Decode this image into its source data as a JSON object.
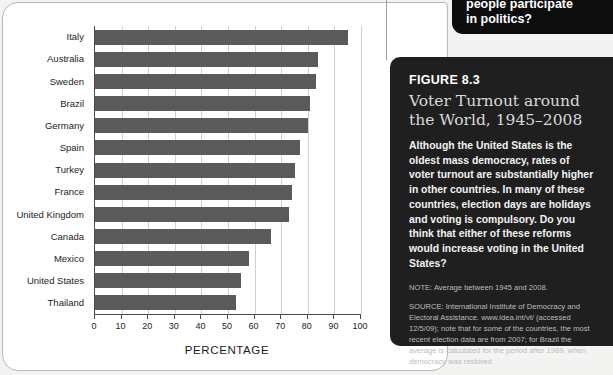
{
  "chart_data": {
    "type": "bar",
    "orientation": "horizontal",
    "title": "Voter Turnout around the World, 1945–2008",
    "xlabel": "PERCENTAGE",
    "ylabel": "",
    "xlim": [
      0,
      100
    ],
    "grid": true,
    "legend": false,
    "bar_color": "#5a5a5a",
    "categories": [
      "Italy",
      "Australia",
      "Sweden",
      "Brazil",
      "Germany",
      "Spain",
      "Turkey",
      "France",
      "United Kingdom",
      "Canada",
      "Mexico",
      "United States",
      "Thailand"
    ],
    "values": [
      95,
      84,
      83,
      81,
      80,
      77,
      75,
      74,
      73,
      66,
      58,
      55,
      53
    ],
    "xticks": [
      0,
      10,
      20,
      30,
      40,
      50,
      60,
      70,
      80,
      90,
      100
    ],
    "xtick_labels": [
      "0",
      "10",
      "20",
      "30",
      "40",
      "50",
      "60",
      "70",
      "80",
      "90",
      "100"
    ]
  },
  "figure_panel": {
    "figure_number": "FIGURE 8.3",
    "title": "Voter Turnout around the World, 1945–2008",
    "body": "Although the United States is the oldest mass democracy, rates of voter turnout are substantially higher in other countries. In many of these countries, election days are holidays and voting is compulsory. Do you think that either of these reforms would increase voting in the United States?",
    "note": "NOTE: Average between 1945 and 2008.",
    "source": "SOURCE: International Institute of Democracy and Electoral Assistance. www.idea.int/vt/ (accessed 12/5/09); note that for some of the countries, the most recent election data are from 2007; for Brazil the average is calculated for the period after 1989, when democracy was restored."
  },
  "top_callout": {
    "line1": "people participate",
    "line2": "in politics?"
  },
  "colors": {
    "panel_background": "#1f1f1f",
    "callout_background": "#0d0d0d",
    "bar": "#5a5a5a",
    "page_background": "#f3f3f1",
    "card_background": "#ffffff"
  }
}
